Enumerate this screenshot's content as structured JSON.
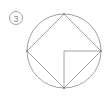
{
  "figure": {
    "label": {
      "text": "3",
      "style": "circled-number",
      "center_x": 16,
      "center_y": 18,
      "radius": 6.5,
      "color": "#8a8a8a"
    },
    "stroke_color": "#8a8a8a",
    "background_color": "#ffffff",
    "stroke_width": 0.8,
    "circle": {
      "center_x": 64,
      "center_y": 51,
      "radius": 37
    },
    "inscribed_square": {
      "name": "diamond",
      "vertices": [
        {
          "name": "top",
          "x": 64,
          "y": 14
        },
        {
          "name": "right",
          "x": 101,
          "y": 51
        },
        {
          "name": "bottom",
          "x": 64,
          "y": 88
        },
        {
          "name": "left",
          "x": 27,
          "y": 51
        }
      ]
    },
    "inner_lines": [
      {
        "name": "center-to-right",
        "x1": 64,
        "y1": 51,
        "x2": 101,
        "y2": 51
      },
      {
        "name": "center-to-bottom",
        "x1": 64,
        "y1": 51,
        "x2": 64,
        "y2": 88
      }
    ],
    "vertex_dots": [
      {
        "name": "dot-top",
        "x": 64,
        "y": 14
      },
      {
        "name": "dot-right",
        "x": 101,
        "y": 51
      },
      {
        "name": "dot-bottom",
        "x": 64,
        "y": 88
      },
      {
        "name": "dot-left",
        "x": 27,
        "y": 51
      }
    ]
  }
}
